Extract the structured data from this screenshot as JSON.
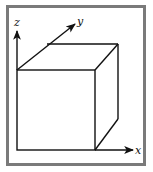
{
  "figure": {
    "type": "3d-cube-axes",
    "axes": {
      "x": {
        "label": "x"
      },
      "y": {
        "label": "y"
      },
      "z": {
        "label": "z"
      }
    },
    "colors": {
      "frame": "#7a7a7a",
      "line": "#111111",
      "background": "#ffffff"
    }
  }
}
